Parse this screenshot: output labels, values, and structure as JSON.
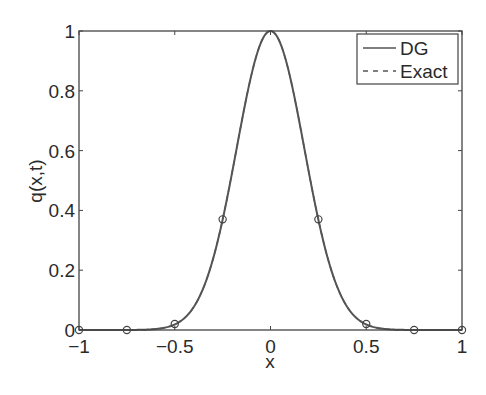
{
  "chart_data": {
    "type": "line",
    "title": "",
    "xlabel": "x",
    "ylabel": "q(x,t)",
    "xlim": [
      -1,
      1
    ],
    "ylim": [
      0,
      1
    ],
    "grid": false,
    "legend_position": "upper right",
    "xticks": [
      -1,
      -0.5,
      0,
      0.5,
      1
    ],
    "xtick_labels": [
      "−1",
      "−0.5",
      "0",
      "0.5",
      "1"
    ],
    "yticks": [
      0,
      0.2,
      0.4,
      0.6,
      0.8,
      1
    ],
    "ytick_labels": [
      "0",
      "0.2",
      "0.4",
      "0.6",
      "0.8",
      "1"
    ],
    "series": [
      {
        "name": "DG",
        "style": "solid",
        "function": "gaussian",
        "sigma": 0.177,
        "x": [
          -1,
          -0.75,
          -0.5,
          -0.4,
          -0.3,
          -0.25,
          -0.2,
          -0.1,
          0,
          0.1,
          0.2,
          0.25,
          0.3,
          0.4,
          0.5,
          0.75,
          1
        ],
        "y": [
          0.0,
          0.0,
          0.02,
          0.08,
          0.24,
          0.37,
          0.53,
          0.85,
          1.0,
          0.85,
          0.53,
          0.37,
          0.24,
          0.08,
          0.02,
          0.0,
          0.0
        ]
      },
      {
        "name": "Exact",
        "style": "dashed",
        "function": "gaussian",
        "sigma": 0.177,
        "x": [
          -1,
          -0.75,
          -0.5,
          -0.4,
          -0.3,
          -0.25,
          -0.2,
          -0.1,
          0,
          0.1,
          0.2,
          0.25,
          0.3,
          0.4,
          0.5,
          0.75,
          1
        ],
        "y": [
          0.0,
          0.0,
          0.02,
          0.08,
          0.24,
          0.37,
          0.53,
          0.85,
          1.0,
          0.85,
          0.53,
          0.37,
          0.24,
          0.08,
          0.02,
          0.0,
          0.0
        ]
      }
    ],
    "markers": {
      "shape": "circle",
      "x": [
        -1,
        -0.75,
        -0.5,
        -0.25,
        0.25,
        0.5,
        0.75,
        1
      ],
      "y": [
        0.0,
        0.0,
        0.02,
        0.37,
        0.37,
        0.02,
        0.0,
        0.0
      ]
    }
  },
  "legend": {
    "items": [
      {
        "label": "DG",
        "style": "solid"
      },
      {
        "label": "Exact",
        "style": "dashed"
      }
    ]
  },
  "colors": {
    "line": "#555555",
    "axes": "#444444",
    "text": "#2a2a2a"
  }
}
